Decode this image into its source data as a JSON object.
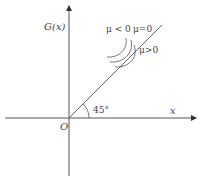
{
  "diagram": {
    "axes": {
      "y_label": "G(x)",
      "x_label": "x",
      "origin_label": "O"
    },
    "line": {
      "angle_label": "45°",
      "description": "line through origin at 45 degrees"
    },
    "curves": {
      "labels": {
        "mu_negative": "μ < 0",
        "mu_zero": "μ=0",
        "mu_positive": "μ>0"
      }
    },
    "colors": {
      "stroke": "#555555",
      "background": "#ffffff"
    }
  }
}
